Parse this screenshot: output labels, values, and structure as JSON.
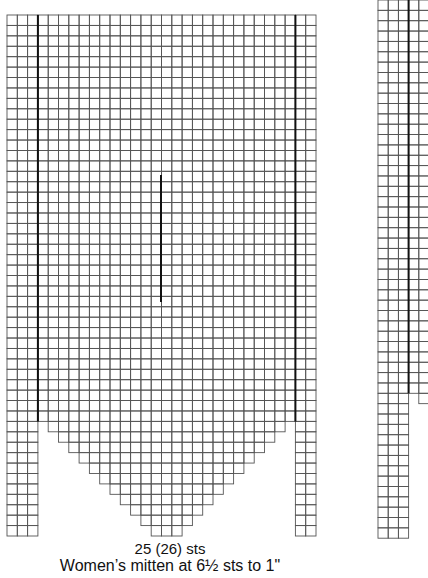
{
  "left_chart": {
    "name": "womens-mitten-chart",
    "origin_x": 7,
    "origin_y": 15,
    "cell_w": 10.3,
    "cell_h": 10.42,
    "columns": 30,
    "full_rows": 39,
    "left_strip_cols": 3,
    "middle_cols": 25,
    "right_strip_cols": 2,
    "staircase_rows": 11,
    "strip_total_rows": 50,
    "thumb_line": {
      "x": 161,
      "y1": 175,
      "y2": 302
    }
  },
  "right_chart": {
    "name": "thumb-chart-partial",
    "origin_x": 378,
    "origin_y": 0,
    "cell_w": 10.2,
    "cell_h": 10.35,
    "strip_cols": 3,
    "extra_cols": 2,
    "full_rows": 38,
    "strip_total_rows": 52
  },
  "colors": {
    "grid": "#555555",
    "thick": "#111111",
    "text": "#111111"
  },
  "captions": {
    "stitches": "25 (26) sts",
    "gauge": "Women’s mitten at 6½ sts to 1\""
  }
}
